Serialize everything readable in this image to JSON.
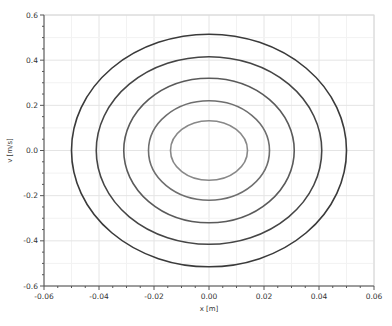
{
  "chart_data": {
    "type": "line",
    "title": "",
    "xlabel": "x [m]",
    "ylabel": "v [m/s]",
    "xlim": [
      -0.06,
      0.06
    ],
    "ylim": [
      -0.6,
      0.6
    ],
    "x_ticks": [
      -0.06,
      -0.04,
      -0.02,
      0.0,
      0.02,
      0.04,
      0.06
    ],
    "x_tick_labels": [
      "-0.06",
      "-0.04",
      "-0.02",
      "0.00",
      "0.02",
      "0.04",
      "0.06"
    ],
    "y_ticks": [
      0.6,
      0.4,
      0.2,
      0.0,
      -0.2,
      -0.4,
      -0.6
    ],
    "y_tick_labels": [
      "0.6",
      "0.4",
      "0.2",
      "0.0",
      "-0.2",
      "-0.4",
      "-0.6"
    ],
    "grid": true,
    "legend": null,
    "series": [
      {
        "name": "orbit 1",
        "shape": "ellipse",
        "center": [
          0,
          0
        ],
        "x_amplitude": 0.05,
        "v_amplitude": 0.515,
        "color": "#3a3a3a"
      },
      {
        "name": "orbit 2",
        "shape": "ellipse",
        "center": [
          0,
          0
        ],
        "x_amplitude": 0.041,
        "v_amplitude": 0.415,
        "color": "#454545"
      },
      {
        "name": "orbit 3",
        "shape": "ellipse",
        "center": [
          0,
          0
        ],
        "x_amplitude": 0.031,
        "v_amplitude": 0.32,
        "color": "#5a5a5a"
      },
      {
        "name": "orbit 4",
        "shape": "ellipse",
        "center": [
          0,
          0
        ],
        "x_amplitude": 0.022,
        "v_amplitude": 0.22,
        "color": "#6e6e6e"
      },
      {
        "name": "orbit 5",
        "shape": "ellipse",
        "center": [
          0,
          0
        ],
        "x_amplitude": 0.014,
        "v_amplitude": 0.132,
        "color": "#888888"
      }
    ]
  },
  "layout": {
    "plot_left": 44,
    "plot_right": 374,
    "plot_top": 15,
    "plot_bottom": 286,
    "grid_major_color": "#e4e4e4",
    "grid_minor_color": "#f2f2f2",
    "axis_color": "#555555"
  }
}
